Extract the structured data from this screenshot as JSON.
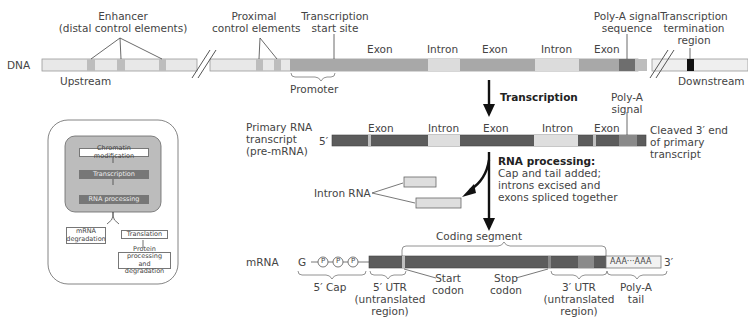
{
  "dna": {
    "label": "DNA",
    "upstream": "Upstream",
    "downstream": "Downstream",
    "enhancer": [
      "Enhancer",
      "(distal control elements)"
    ],
    "proximal": [
      "Proximal",
      "control elements"
    ],
    "tss": [
      "Transcription",
      "start site"
    ],
    "promoter": "Promoter",
    "segments": [
      "Exon",
      "Intron",
      "Exon",
      "Intron",
      "Exon"
    ],
    "polya_signal_seq": [
      "Poly-A signal",
      "sequence"
    ],
    "termination": [
      "Transcription",
      "termination",
      "region"
    ]
  },
  "steps": {
    "transcription": "Transcription",
    "rna_processing_title": "RNA processing:",
    "rna_processing_desc": [
      "Cap and tail added;",
      "introns excised and",
      "exons spliced together"
    ]
  },
  "pre_mrna": {
    "label": [
      "Primary RNA",
      "transcript",
      "(pre-mRNA)"
    ],
    "five_prime": "5′",
    "segments": [
      "Exon",
      "Intron",
      "Exon",
      "Intron",
      "Exon"
    ],
    "polya_signal": [
      "Poly-A",
      "signal"
    ],
    "cleaved": [
      "Cleaved 3′ end",
      "of primary",
      "transcript"
    ]
  },
  "intron_rna": {
    "label": "Intron RNA"
  },
  "mrna": {
    "label": "mRNA",
    "cap_g": "G",
    "phosphate": "P",
    "coding_segment": "Coding segment",
    "tail_text": "AAA···AAA",
    "three_prime": "3′",
    "five_cap": "5′ Cap",
    "utr5": [
      "5′ UTR",
      "(untranslated",
      "region)"
    ],
    "start_codon": [
      "Start",
      "codon"
    ],
    "stop_codon": [
      "Stop",
      "codon"
    ],
    "utr3": [
      "3′ UTR",
      "(untranslated",
      "region)"
    ],
    "polya_tail": [
      "Poly-A",
      "tail"
    ]
  },
  "inset": {
    "chromatin": "Chromatin modification",
    "transcription": "Transcription",
    "rna_processing": "RNA processing",
    "mrna_degradation": [
      "mRNA",
      "degradation"
    ],
    "translation": "Translation",
    "protein": [
      "Protein processing",
      "and degradation"
    ]
  },
  "colors": {
    "dna_light": "#e6e6e6",
    "control_element": "#bdbdbd",
    "exon_dna": "#a8a8a8",
    "intron_dna": "#dcdcdc",
    "polya_signal_dna": "#6e6e6e",
    "termination": "#111111",
    "exon_rna": "#5c5c5c",
    "intron_rna": "#dedede",
    "polya_signal_rna": "#8a8a8a"
  }
}
